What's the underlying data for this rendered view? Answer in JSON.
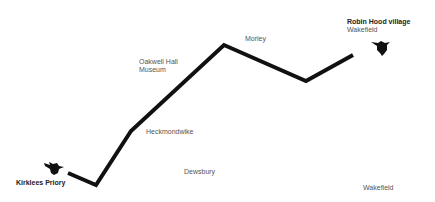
{
  "map": {
    "route": {
      "color": "#111111",
      "points": "68,173 96,185 131,131 224,45 306,81 353,55"
    },
    "places": {
      "start": {
        "name": "Kirklees Priory"
      },
      "end": {
        "name": "Robin Hood village",
        "subtitle": "Wakefield"
      },
      "oakwell": {
        "line1": "Oakwell Hall",
        "line2": "Museum"
      },
      "morley": {
        "name": "Morley"
      },
      "heckmondwike": {
        "name": "Heckmondwike"
      },
      "dewsbury": {
        "name": "Dewsbury"
      },
      "wakefield": {
        "name": "Wakefield"
      }
    }
  }
}
